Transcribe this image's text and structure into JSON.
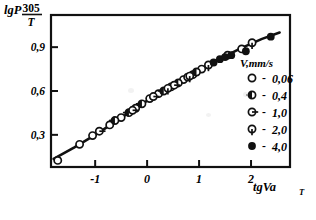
{
  "figure": {
    "background": "#ffffff",
    "ink": "#111111"
  },
  "axes": {
    "y_label_main": "lgP",
    "y_label_numerator": "305",
    "y_label_denominator": "T",
    "x_label": "tgVa",
    "x_label_subscript": "T",
    "y_ticks": [
      "0,3",
      "0,6",
      "0,9"
    ],
    "x_ticks": [
      "-1",
      "0",
      "1",
      "2"
    ]
  },
  "legend": {
    "title": "V,mm/s",
    "dash": "-",
    "items": [
      {
        "marker": "open-circle",
        "value": "0,06"
      },
      {
        "marker": "circle-left-filled",
        "value": "0,4"
      },
      {
        "marker": "circle-right-tick",
        "value": "1,0"
      },
      {
        "marker": "circle-down-tick",
        "value": "2,0"
      },
      {
        "marker": "filled-circle",
        "value": "4,0"
      }
    ]
  },
  "chart_data": {
    "type": "scatter",
    "title": "",
    "xlabel": "tgVa_T",
    "ylabel": "lgP 305/T",
    "xlim": [
      -1.85,
      2.75
    ],
    "ylim": [
      0.08,
      1.12
    ],
    "grid": false,
    "legend_position": "right",
    "x_ticks": [
      -1,
      0,
      1,
      2
    ],
    "y_ticks": [
      0.3,
      0.6,
      0.9
    ],
    "fit_curve": {
      "name": "master curve",
      "x": [
        -1.8,
        -1.4,
        -1.0,
        -0.6,
        -0.2,
        0.2,
        0.6,
        1.0,
        1.4,
        1.8,
        2.2,
        2.55
      ],
      "y": [
        0.135,
        0.215,
        0.3,
        0.392,
        0.488,
        0.578,
        0.662,
        0.742,
        0.82,
        0.892,
        0.955,
        1.0
      ]
    },
    "series": [
      {
        "name": "0,06",
        "marker": "open-circle",
        "points": [
          [
            -1.72,
            0.125
          ],
          [
            -1.3,
            0.235
          ],
          [
            -1.05,
            0.295
          ],
          [
            -0.72,
            0.368
          ],
          [
            -0.5,
            0.418
          ],
          [
            -0.22,
            0.482
          ],
          [
            0.05,
            0.548
          ],
          [
            0.22,
            0.582
          ],
          [
            0.46,
            0.628
          ],
          [
            0.7,
            0.678
          ],
          [
            0.88,
            0.712
          ],
          [
            1.05,
            0.75
          ],
          [
            1.55,
            0.845
          ],
          [
            1.82,
            0.888
          ]
        ]
      },
      {
        "name": "0,4",
        "marker": "circle-left-filled",
        "points": [
          [
            -0.62,
            0.398
          ],
          [
            -0.35,
            0.452
          ],
          [
            -0.1,
            0.512
          ],
          [
            0.32,
            0.6
          ],
          [
            0.6,
            0.655
          ],
          [
            0.95,
            0.73
          ]
        ]
      },
      {
        "name": "1,0",
        "marker": "circle-right-tick",
        "points": [
          [
            -0.92,
            0.325
          ],
          [
            -0.28,
            0.468
          ],
          [
            0.12,
            0.562
          ],
          [
            0.52,
            0.64
          ],
          [
            0.78,
            0.695
          ]
        ]
      },
      {
        "name": "2,0",
        "marker": "circle-down-tick",
        "points": [
          [
            0.4,
            0.618
          ],
          [
            0.82,
            0.702
          ],
          [
            1.18,
            0.778
          ],
          [
            2.02,
            0.93
          ]
        ]
      },
      {
        "name": "4,0",
        "marker": "filled-circle",
        "points": [
          [
            1.28,
            0.795
          ],
          [
            1.4,
            0.818
          ],
          [
            1.5,
            0.832
          ],
          [
            1.62,
            0.845
          ],
          [
            1.9,
            0.872
          ],
          [
            2.38,
            0.972
          ]
        ]
      }
    ]
  }
}
